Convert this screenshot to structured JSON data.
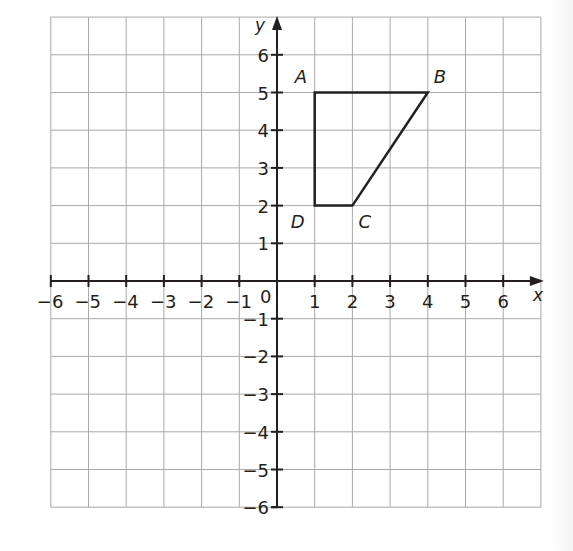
{
  "chart_data": {
    "type": "scatter",
    "title": "",
    "xlabel": "x",
    "ylabel": "y",
    "xlim": [
      -6,
      7
    ],
    "ylim": [
      -6,
      7
    ],
    "grid": true,
    "x_ticks": [
      -6,
      -5,
      -4,
      -3,
      -2,
      -1,
      0,
      1,
      2,
      3,
      4,
      5,
      6
    ],
    "y_ticks": [
      -6,
      -5,
      -4,
      -3,
      -2,
      -1,
      1,
      2,
      3,
      4,
      5,
      6
    ],
    "x_tick_labels": [
      "−6",
      "−5",
      "−4",
      "−3",
      "−2",
      "−1",
      "1",
      "2",
      "3",
      "4",
      "5",
      "6"
    ],
    "y_tick_labels": [
      "−6",
      "−5",
      "−4",
      "−3",
      "−2",
      "−1",
      "1",
      "2",
      "3",
      "4",
      "5",
      "6"
    ],
    "origin_label": "0",
    "shapes": [
      {
        "name": "quadrilateral ABCD",
        "closed": true,
        "vertices": [
          {
            "label": "A",
            "x": 1,
            "y": 5
          },
          {
            "label": "B",
            "x": 4,
            "y": 5
          },
          {
            "label": "C",
            "x": 2,
            "y": 2
          },
          {
            "label": "D",
            "x": 1,
            "y": 2
          }
        ]
      }
    ]
  },
  "axes": {
    "x_label": "x",
    "y_label": "y",
    "origin": "0"
  },
  "labels": {
    "A": "A",
    "B": "B",
    "C": "C",
    "D": "D"
  },
  "colors": {
    "grid": "#a9a9a9",
    "axis": "#231f20",
    "shape": "#231f20",
    "background": "#ffffff"
  }
}
